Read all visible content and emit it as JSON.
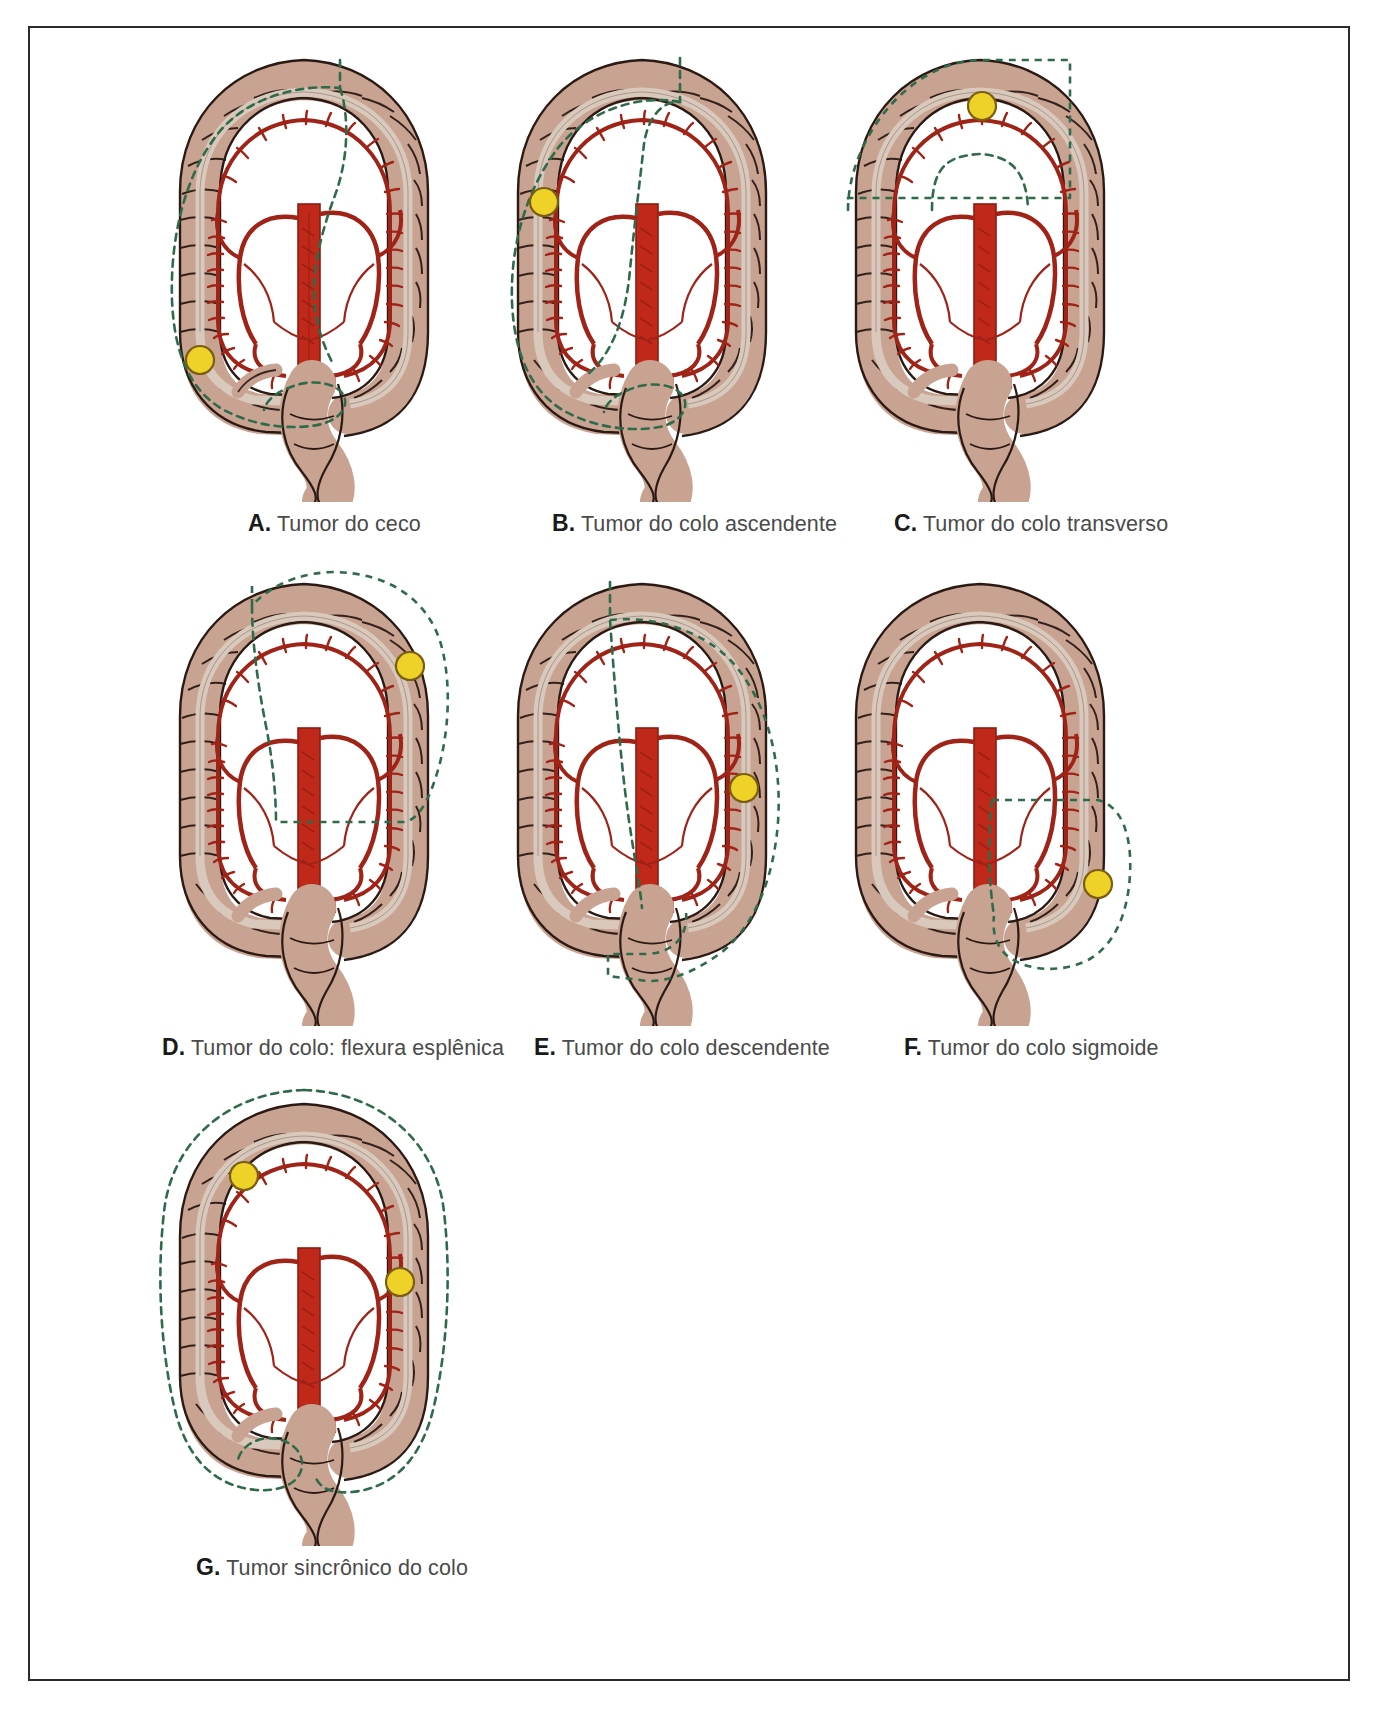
{
  "figure": {
    "language": "pt-BR",
    "panel_count": 7,
    "colors": {
      "colon_fill": "#c9a391",
      "colon_outline": "#2b1a14",
      "artery": "#a02318",
      "artery_major": "#c0281a",
      "resection_line": "#2f6b4a",
      "tumor": "#efd227",
      "tumor_outline": "#7a5f12",
      "taenia": "#d9c9bd",
      "frame": "#2b2b2b",
      "caption_label": "#1a1a1a",
      "caption_text": "#4a4a4a",
      "background": "#ffffff"
    }
  },
  "panels": [
    {
      "id": "A",
      "label": "A.",
      "text": "Tumor do ceco",
      "caption": "A. Tumor do ceco",
      "tumor_sites": [
        "ceco"
      ],
      "tumor_count": 1,
      "resection": "hemicolectomia direita",
      "tumor_markers": [
        {
          "x": 0.11,
          "y": 0.61
        }
      ]
    },
    {
      "id": "B",
      "label": "B.",
      "text": "Tumor do colo ascendente",
      "caption": "B. Tumor do colo ascendente",
      "tumor_sites": [
        "colo ascendente"
      ],
      "tumor_count": 1,
      "resection": "hemicolectomia direita",
      "tumor_markers": [
        {
          "x": 0.12,
          "y": 0.31
        }
      ]
    },
    {
      "id": "C",
      "label": "C.",
      "text": "Tumor do colo transverso",
      "caption": "C. Tumor do colo transverso",
      "tumor_sites": [
        "colo transverso"
      ],
      "tumor_count": 1,
      "resection": "colectomia transversa",
      "tumor_markers": [
        {
          "x": 0.55,
          "y": 0.1
        }
      ]
    },
    {
      "id": "D",
      "label": "D.",
      "text": "Tumor do colo: flexura esplênica",
      "caption": "D. Tumor do colo: flexura esplênica",
      "tumor_sites": [
        "flexura esplênica"
      ],
      "tumor_count": 1,
      "resection": "colectomia esquerda estendida",
      "tumor_markers": [
        {
          "x": 0.81,
          "y": 0.16
        }
      ]
    },
    {
      "id": "E",
      "label": "E.",
      "text": "Tumor do colo descendente",
      "caption": "E. Tumor do colo descendente",
      "tumor_sites": [
        "colo descendente"
      ],
      "tumor_count": 1,
      "resection": "hemicolectomia esquerda",
      "tumor_markers": [
        {
          "x": 0.83,
          "y": 0.41
        }
      ]
    },
    {
      "id": "F",
      "label": "F.",
      "text": "Tumor do colo sigmoide",
      "caption": "F. Tumor do colo sigmoide",
      "tumor_sites": [
        "colo sigmoide"
      ],
      "tumor_count": 1,
      "resection": "sigmoidectomia",
      "tumor_markers": [
        {
          "x": 0.86,
          "y": 0.64
        }
      ]
    },
    {
      "id": "G",
      "label": "G.",
      "text": "Tumor sincrônico do colo",
      "caption": "G. Tumor sincrônico do colo",
      "tumor_sites": [
        "colo ascendente",
        "colo descendente"
      ],
      "tumor_count": 2,
      "resection": "colectomia subtotal",
      "tumor_markers": [
        {
          "x": 0.2,
          "y": 0.2
        },
        {
          "x": 0.8,
          "y": 0.44
        }
      ]
    }
  ]
}
